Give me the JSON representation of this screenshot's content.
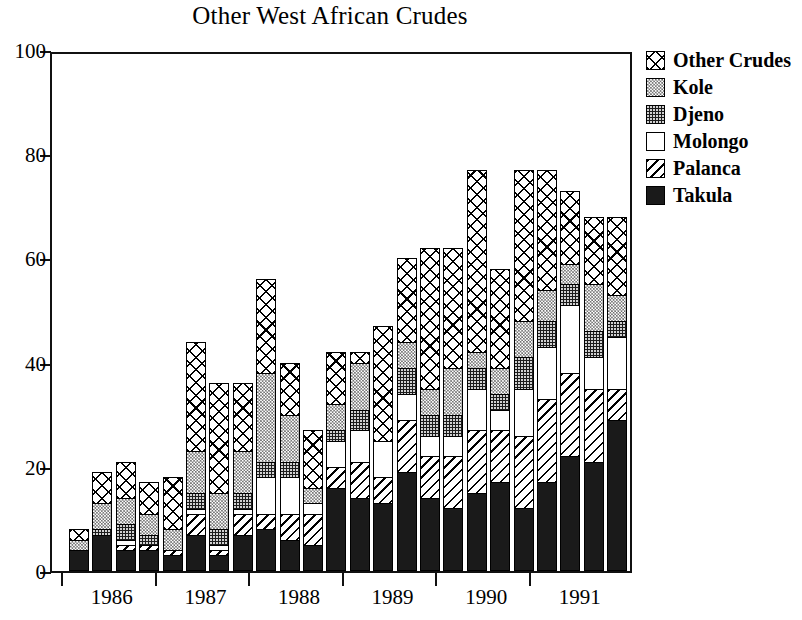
{
  "chart_data": {
    "type": "bar",
    "barmode": "stacked",
    "title": "Other West African Crudes",
    "xlabel": "",
    "ylabel": "",
    "ylim": [
      0,
      100
    ],
    "yticks": [
      0,
      20,
      40,
      60,
      80,
      100
    ],
    "ytick_labels": [
      "0",
      "20",
      "40",
      "60",
      "80",
      "100"
    ],
    "grid": false,
    "legend_position": "right",
    "categories": [
      "1986 Q1",
      "1986 Q2",
      "1986 Q3",
      "1986 Q4",
      "1987 Q1",
      "1987 Q2",
      "1987 Q3",
      "1987 Q4",
      "1988 Q1",
      "1988 Q2",
      "1988 Q3",
      "1988 Q4",
      "1989 Q1",
      "1989 Q2",
      "1989 Q3",
      "1989 Q4",
      "1990 Q1",
      "1990 Q2",
      "1990 Q3",
      "1990 Q4",
      "1991 Q1",
      "1991 Q2",
      "1991 Q3",
      "1991 Q4"
    ],
    "x_tick_labels": [
      "1986",
      "1987",
      "1988",
      "1989",
      "1990",
      "1991"
    ],
    "series": [
      {
        "name": "Takula",
        "pattern": "solid-black",
        "values": [
          4,
          7,
          4,
          4,
          3,
          7,
          3,
          7,
          8,
          6,
          5,
          16,
          14,
          13,
          19,
          14,
          12,
          15,
          17,
          12,
          17,
          22,
          21,
          29
        ]
      },
      {
        "name": "Palanca",
        "pattern": "diagonal-hatch",
        "values": [
          0,
          0,
          1,
          1,
          1,
          4,
          1,
          4,
          3,
          5,
          6,
          4,
          7,
          5,
          10,
          8,
          10,
          12,
          10,
          14,
          16,
          16,
          14,
          6
        ]
      },
      {
        "name": "Molongo",
        "pattern": "white",
        "values": [
          0,
          0,
          1,
          0,
          0,
          1,
          1,
          1,
          7,
          7,
          2,
          5,
          6,
          7,
          5,
          4,
          4,
          8,
          4,
          9,
          10,
          13,
          6,
          10
        ]
      },
      {
        "name": "Djeno",
        "pattern": "dark-dotted",
        "values": [
          0,
          1,
          3,
          2,
          0,
          3,
          3,
          3,
          3,
          3,
          0,
          2,
          4,
          0,
          5,
          4,
          4,
          4,
          3,
          6,
          5,
          4,
          5,
          3
        ]
      },
      {
        "name": "Kole",
        "pattern": "gray-checker",
        "values": [
          2,
          5,
          5,
          4,
          4,
          8,
          7,
          8,
          17,
          9,
          3,
          5,
          9,
          0,
          5,
          5,
          9,
          3,
          5,
          7,
          6,
          4,
          9,
          5
        ]
      },
      {
        "name": "Other Crudes",
        "pattern": "cross-hatch",
        "values": [
          2,
          6,
          7,
          6,
          10,
          21,
          21,
          13,
          18,
          10,
          11,
          10,
          2,
          22,
          16,
          27,
          23,
          35,
          19,
          29,
          23,
          14,
          13,
          15
        ]
      }
    ],
    "totals": [
      8,
      19,
      21,
      17,
      18,
      44,
      36,
      36,
      56,
      40,
      27,
      42,
      42,
      47,
      60,
      62,
      62,
      77,
      58,
      77,
      77,
      73,
      68,
      68
    ]
  },
  "legend": {
    "items": [
      {
        "label": "Other Crudes",
        "pattern": "cross-hatch"
      },
      {
        "label": "Kole",
        "pattern": "gray-checker"
      },
      {
        "label": "Djeno",
        "pattern": "dark-dotted"
      },
      {
        "label": "Molongo",
        "pattern": "white"
      },
      {
        "label": "Palanca",
        "pattern": "diagonal-hatch"
      },
      {
        "label": "Takula",
        "pattern": "solid-black"
      }
    ]
  }
}
